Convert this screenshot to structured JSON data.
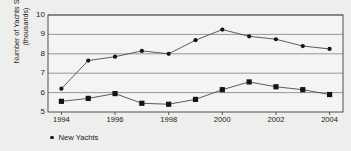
{
  "chart_data": {
    "type": "line",
    "title": "",
    "xlabel": "",
    "ylabel": "Number of Yachts Sold (thousands)",
    "ylabel_line1": "Number of Yachts Sold",
    "ylabel_line2": "(thousands)",
    "x": [
      1994,
      1995,
      1996,
      1997,
      1998,
      1999,
      2000,
      2001,
      2002,
      2003,
      2004
    ],
    "xtick_labels": [
      "1994",
      "1996",
      "1998",
      "2000",
      "2002",
      "2004"
    ],
    "xticks": [
      1994,
      1996,
      1998,
      2000,
      2002,
      2004
    ],
    "ytick_labels": [
      "5",
      "6",
      "7",
      "8",
      "9",
      "10"
    ],
    "yticks": [
      5,
      6,
      7,
      8,
      9,
      10
    ],
    "ylim": [
      5,
      10
    ],
    "xlim": [
      1993.5,
      2004.5
    ],
    "grid": true,
    "grid_axis": "y",
    "legend_position": "bottom-left",
    "series": [
      {
        "name": "Used Yachts",
        "marker": "circle",
        "values": [
          6.2,
          7.65,
          7.85,
          8.15,
          8.0,
          8.7,
          9.25,
          8.9,
          8.75,
          8.4,
          8.25
        ]
      },
      {
        "name": "New Yachts",
        "marker": "square",
        "values": [
          5.55,
          5.7,
          5.95,
          5.45,
          5.4,
          5.65,
          6.15,
          6.55,
          6.3,
          6.15,
          5.9
        ]
      }
    ],
    "colors": {
      "background": "#eeeeec",
      "plot_background": "#f4f4f2",
      "grid": "#808080",
      "axis": "#3c3c3c",
      "marker": "#141414",
      "line": "#4a4a4a"
    }
  },
  "legend": {
    "items": [
      {
        "label": "New Yachts",
        "marker": "circle"
      }
    ]
  }
}
